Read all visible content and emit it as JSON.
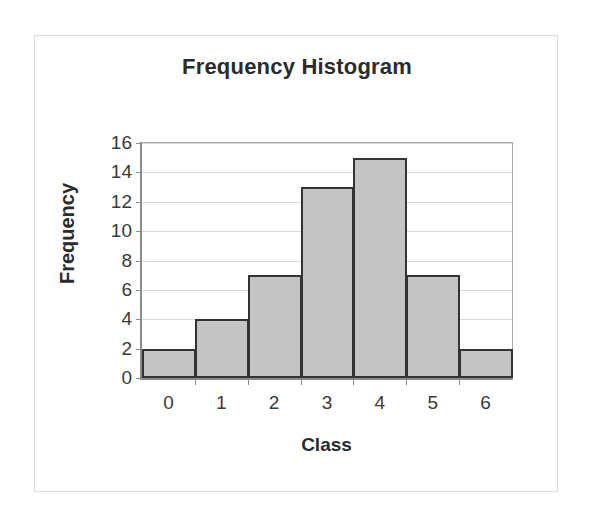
{
  "chart_data": {
    "type": "bar",
    "title": "Frequency Histogram",
    "xlabel": "Class",
    "ylabel": "Frequency",
    "categories": [
      "0",
      "1",
      "2",
      "3",
      "4",
      "5",
      "6"
    ],
    "values": [
      2,
      4,
      7,
      13,
      15,
      7,
      2
    ],
    "ylim": [
      0,
      16
    ],
    "ytick_labels": [
      "0",
      "2",
      "4",
      "6",
      "8",
      "10",
      "12",
      "14",
      "16"
    ],
    "ytick_values": [
      0,
      2,
      4,
      6,
      8,
      10,
      12,
      14,
      16
    ],
    "grid": true,
    "grid_axis": "y",
    "legend": false,
    "bar_gap": 0,
    "series": [
      {
        "name": "Frequency",
        "values": [
          2,
          4,
          7,
          13,
          15,
          7,
          2
        ]
      }
    ]
  },
  "style": {
    "bar_fill": "#c4c4c4",
    "bar_border": "#333333",
    "gridline_color": "#d9d9d9",
    "axis_color": "#8a8a8a",
    "text_color": "#2b2b2b",
    "tick_text_color": "#3a3a3a",
    "frame_color": "#dcdcdc",
    "background": "#ffffff"
  }
}
